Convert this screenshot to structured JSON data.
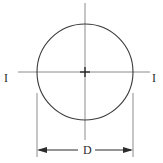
{
  "diagram": {
    "background_color": "#ffffff",
    "stroke_color": "#3a3a3a",
    "centerline_color": "#8c8c8c",
    "dimension_color": "#2b2b2b",
    "shape": {
      "name": "circle",
      "center_x": 85,
      "center_y": 72,
      "radius": 48,
      "stroke_width": 1.1
    },
    "center_mark": {
      "name": "center-cross",
      "size": 9
    },
    "centerlines": {
      "vertical": {
        "x": 85,
        "y1": 3,
        "y2": 140
      },
      "horizontal": {
        "y": 72,
        "x1": 18,
        "x2": 150
      }
    },
    "extension_lines": {
      "left": {
        "x": 37,
        "y1": 93,
        "y2": 157
      },
      "right": {
        "x": 133,
        "y1": 93,
        "y2": 157
      }
    },
    "dimension_line": {
      "y": 150,
      "x1": 37,
      "x2": 133,
      "arrow_direction": "outward"
    },
    "labels": {
      "axis_left": "I",
      "axis_right": "I",
      "diameter": "D"
    }
  }
}
